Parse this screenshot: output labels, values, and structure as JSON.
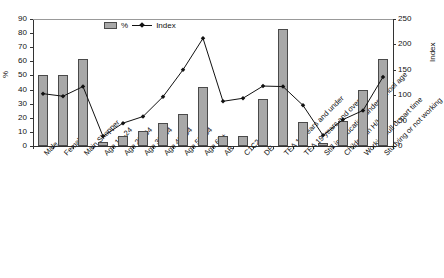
{
  "chart_data": {
    "type": "bar",
    "title": "",
    "xlabel": "",
    "ylabel": "%",
    "y2label": "Index",
    "ylim": [
      0,
      90
    ],
    "y2lim": [
      0,
      250
    ],
    "yticks": [
      0,
      10,
      20,
      30,
      40,
      50,
      60,
      70,
      80,
      90
    ],
    "y2ticks": [
      0,
      50,
      100,
      150,
      200,
      250
    ],
    "grid": false,
    "legend": {
      "position": "top-center",
      "entries": [
        {
          "label": "%",
          "type": "bar",
          "color": "#a8a8a8"
        },
        {
          "label": "Index",
          "type": "line",
          "color": "#111111"
        }
      ]
    },
    "categories": [
      "Male",
      "Female",
      "Main Shopper",
      "Age 15–24",
      "Age 25–34",
      "Age 35–44",
      "Age 45–54",
      "Age 55–64",
      "Age 65+",
      "AB",
      "C1C2",
      "DE",
      "TEA 18 years and under",
      "TEA 19 years and over",
      "Still in education/under school age",
      "Children in H/H",
      "Working full or part time",
      "Studying or not working"
    ],
    "series": [
      {
        "name": "%",
        "axis": "left",
        "values": [
          50,
          50,
          62,
          3,
          7,
          10.5,
          16,
          22.5,
          41.5,
          7,
          7,
          33,
          83,
          17,
          2,
          17.5,
          39.5,
          62
        ]
      },
      {
        "name": "Index",
        "axis": "right",
        "values": [
          103,
          98,
          117,
          19,
          45,
          58,
          97,
          150,
          212,
          88,
          94,
          118,
          117,
          80,
          21,
          52,
          70,
          136
        ]
      }
    ]
  }
}
